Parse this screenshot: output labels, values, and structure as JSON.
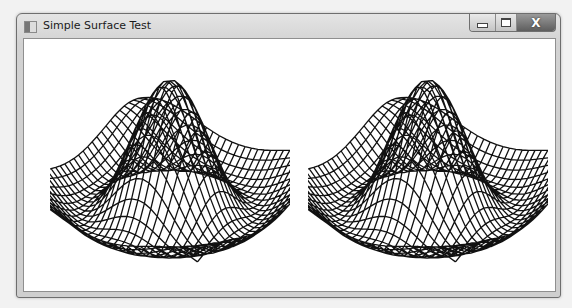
{
  "window": {
    "title": "Simple Surface Test",
    "icon": "app-window-icon",
    "controls": {
      "minimize": {
        "icon": "minimize-icon"
      },
      "maximize": {
        "icon": "maximize-icon"
      },
      "close": {
        "icon": "close-icon",
        "glyph": "X"
      }
    }
  },
  "plots": [
    {
      "name": "surface-plot-left",
      "grid": 30,
      "line_color": "#111111",
      "projection": "perspective"
    },
    {
      "name": "surface-plot-right",
      "grid": 30,
      "line_color": "#111111",
      "projection": "perspective"
    }
  ]
}
